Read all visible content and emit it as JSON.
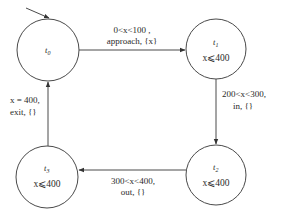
{
  "diagram": {
    "type": "timed-automaton",
    "colors": {
      "stroke": "#4a4a4a",
      "text": "#2a2a2a",
      "background": "#ffffff"
    },
    "initial_state": "t0",
    "states": [
      {
        "id": "t0",
        "name": "t",
        "sub": "0",
        "invariant": ""
      },
      {
        "id": "t1",
        "name": "t",
        "sub": "1",
        "invariant": "x⩽400"
      },
      {
        "id": "t2",
        "name": "t",
        "sub": "2",
        "invariant": "x⩽400"
      },
      {
        "id": "t3",
        "name": "t",
        "sub": "3",
        "invariant": "x⩽400"
      }
    ],
    "transitions": [
      {
        "from": "t0",
        "to": "t1",
        "guard": "0<x<100 ,",
        "action": "approach, {x}"
      },
      {
        "from": "t1",
        "to": "t2",
        "guard": "200<x<300,",
        "action": "in, {}"
      },
      {
        "from": "t2",
        "to": "t3",
        "guard": "300<x<400,",
        "action": "out, {}"
      },
      {
        "from": "t3",
        "to": "t0",
        "guard": "x = 400,",
        "action": "exit, {}"
      }
    ]
  }
}
